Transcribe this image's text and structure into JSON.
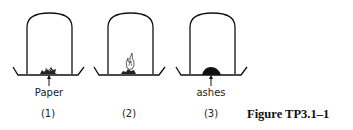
{
  "figure": {
    "caption": "Figure TP3.1–1",
    "panels": [
      {
        "number": "(1)",
        "label": "Paper",
        "content": "crumpled-paper"
      },
      {
        "number": "(2)",
        "label": "",
        "content": "burning-paper"
      },
      {
        "number": "(3)",
        "label": "ashes",
        "content": "ash-pile"
      }
    ]
  }
}
